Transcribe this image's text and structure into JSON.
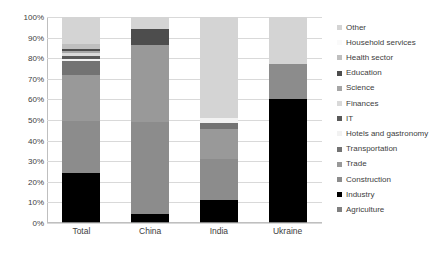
{
  "chart_data": {
    "type": "bar",
    "subtype": "stacked-100-percent",
    "title": "",
    "xlabel": "",
    "ylabel": "",
    "ylim": [
      0,
      100
    ],
    "ytick_labels": [
      "0%",
      "10%",
      "20%",
      "30%",
      "40%",
      "50%",
      "60%",
      "70%",
      "80%",
      "90%",
      "100%"
    ],
    "ytick_values": [
      0,
      10,
      20,
      30,
      40,
      50,
      60,
      70,
      80,
      90,
      100
    ],
    "grid": true,
    "legend_position": "right",
    "legend_order": "reverse-stack",
    "categories": [
      "Total",
      "China",
      "India",
      "Ukraine"
    ],
    "series": [
      {
        "name": "Agriculture",
        "color": "#808080",
        "values": [
          0.5,
          0.4,
          0.5,
          0.6
        ]
      },
      {
        "name": "Industry",
        "color": "#000000",
        "values": [
          24.0,
          3.8,
          10.5,
          59.5
        ]
      },
      {
        "name": "Construction",
        "color": "#8c8c8c",
        "values": [
          25.0,
          45.0,
          20.0,
          17.0
        ]
      },
      {
        "name": "Trade",
        "color": "#999999",
        "values": [
          22.5,
          37.0,
          14.5,
          0.0
        ]
      },
      {
        "name": "Transportation",
        "color": "#737373",
        "values": [
          6.5,
          0.0,
          3.0,
          0.0
        ]
      },
      {
        "name": "Hotels and gastronomy",
        "color": "#f2f2f2",
        "values": [
          1.0,
          0.0,
          2.5,
          0.0
        ]
      },
      {
        "name": "IT",
        "color": "#595959",
        "values": [
          1.5,
          0.0,
          0.0,
          0.0
        ]
      },
      {
        "name": "Finances",
        "color": "#d9d9d9",
        "values": [
          1.5,
          0.0,
          0.0,
          0.0
        ]
      },
      {
        "name": "Science",
        "color": "#a6a6a6",
        "values": [
          1.0,
          0.0,
          0.0,
          0.0
        ]
      },
      {
        "name": "Education",
        "color": "#4d4d4d",
        "values": [
          1.0,
          8.0,
          0.0,
          0.0
        ]
      },
      {
        "name": "Health sector",
        "color": "#bfbfbf",
        "values": [
          2.5,
          0.0,
          0.0,
          0.0
        ]
      },
      {
        "name": "Household services",
        "color": "#fafafa",
        "values": [
          0.0,
          0.0,
          0.0,
          0.0
        ]
      },
      {
        "name": "Other",
        "color": "#d4d4d4",
        "values": [
          13.0,
          5.8,
          49.0,
          22.9
        ]
      }
    ]
  },
  "legend": {
    "items": [
      {
        "label": "Other",
        "color": "#d4d4d4"
      },
      {
        "label": "Household services",
        "color": "#fafafa"
      },
      {
        "label": "Health sector",
        "color": "#bfbfbf"
      },
      {
        "label": "Education",
        "color": "#4d4d4d"
      },
      {
        "label": "Science",
        "color": "#a6a6a6"
      },
      {
        "label": "Finances",
        "color": "#d9d9d9"
      },
      {
        "label": "IT",
        "color": "#595959"
      },
      {
        "label": "Hotels and gastronomy",
        "color": "#f2f2f2"
      },
      {
        "label": "Transportation",
        "color": "#737373"
      },
      {
        "label": "Trade",
        "color": "#999999"
      },
      {
        "label": "Construction",
        "color": "#8c8c8c"
      },
      {
        "label": "Industry",
        "color": "#000000"
      },
      {
        "label": "Agriculture",
        "color": "#808080"
      }
    ]
  },
  "colors": {
    "gridline": "#d9d9d9",
    "axis": "#bfbfbf",
    "tick_label": "#404040",
    "background": "#ffffff"
  }
}
